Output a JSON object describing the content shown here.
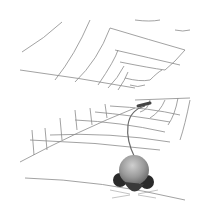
{
  "illustration": {
    "subject": "mouse on a spiral web of lines",
    "colors": {
      "background": "#ffffff",
      "line": "#8a8a8a",
      "mouse_body": "#9a9a9a",
      "mouse_ears": "#2a2a2a",
      "tail": "#6a6a6a"
    }
  }
}
